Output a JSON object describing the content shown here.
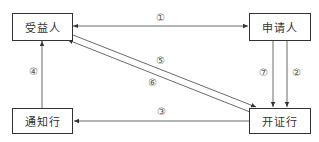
{
  "diagram": {
    "nodes": [
      {
        "id": "beneficiary",
        "label": "受益人"
      },
      {
        "id": "applicant",
        "label": "申请人"
      },
      {
        "id": "advising_bank",
        "label": "通知行"
      },
      {
        "id": "issuing_bank",
        "label": "开证行"
      }
    ],
    "edges": [
      {
        "id": "e1",
        "label": "①",
        "from": "beneficiary",
        "to": "applicant",
        "direction": "both"
      },
      {
        "id": "e2",
        "label": "②",
        "from": "applicant",
        "to": "issuing_bank"
      },
      {
        "id": "e3",
        "label": "③",
        "from": "issuing_bank",
        "to": "advising_bank"
      },
      {
        "id": "e4",
        "label": "④",
        "from": "advising_bank",
        "to": "beneficiary"
      },
      {
        "id": "e5",
        "label": "⑤",
        "from": "beneficiary",
        "to": "issuing_bank"
      },
      {
        "id": "e6",
        "label": "⑥",
        "from": "issuing_bank",
        "to": "beneficiary"
      },
      {
        "id": "e7",
        "label": "⑦",
        "from": "applicant",
        "to": "issuing_bank"
      }
    ],
    "colors": {
      "line": "#333333",
      "text": "#333333",
      "background": "#ffffff"
    }
  }
}
